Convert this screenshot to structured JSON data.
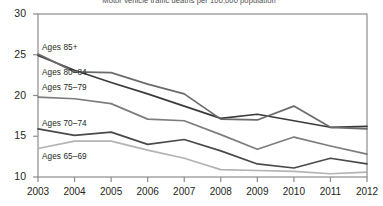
{
  "chart_data": {
    "type": "line",
    "title": "Motor vehicle traffic deaths per 100,000 population",
    "xlabel": "",
    "ylabel": "",
    "x": [
      2003,
      2004,
      2005,
      2006,
      2007,
      2008,
      2009,
      2010,
      2011,
      2012
    ],
    "xtick_labels": [
      "2003",
      "2004",
      "2005",
      "2006",
      "2007",
      "2008",
      "2009",
      "2010",
      "2011",
      "2012"
    ],
    "ytick_labels": [
      "10",
      "15",
      "20",
      "25",
      "30"
    ],
    "ytick_values": [
      10,
      15,
      20,
      25,
      30
    ],
    "ylim": [
      10,
      30
    ],
    "xlim": [
      2003,
      2012
    ],
    "grid": false,
    "legend_position": "inline-labels",
    "series": [
      {
        "name": "Ages 85+",
        "label": "Ages 85+",
        "color": "#3b3b3b",
        "values": [
          24.9,
          23.1,
          21.6,
          20.2,
          18.7,
          17.2,
          17.7,
          16.9,
          16.1,
          16.2
        ],
        "label_x": 42,
        "label_y": 43
      },
      {
        "name": "Ages 80-84",
        "label": "Ages 80–84",
        "color": "#6b6b6b",
        "values": [
          25.1,
          22.9,
          22.8,
          21.4,
          20.2,
          17.1,
          17.0,
          18.7,
          16.1,
          15.9
        ],
        "label_x": 42,
        "label_y": 68
      },
      {
        "name": "Ages 75-79",
        "label": "Ages 75–79",
        "color": "#7d7d7d",
        "values": [
          19.8,
          19.6,
          19.0,
          17.1,
          16.9,
          15.2,
          13.4,
          14.9,
          13.8,
          12.8
        ],
        "label_x": 42,
        "label_y": 83
      },
      {
        "name": "Ages 70-74",
        "label": "Ages 70–74",
        "color": "#4a4a4a",
        "values": [
          15.9,
          15.1,
          15.5,
          14.0,
          14.6,
          13.2,
          11.6,
          11.1,
          12.3,
          11.6
        ],
        "label_x": 42,
        "label_y": 119
      },
      {
        "name": "Ages 65-69",
        "label": "Ages 65–69",
        "color": "#b3b3b3",
        "values": [
          13.5,
          14.4,
          14.4,
          13.3,
          12.3,
          10.9,
          10.8,
          10.7,
          10.4,
          10.6
        ],
        "label_x": 42,
        "label_y": 152
      }
    ]
  },
  "axes": {
    "plot_left": 38,
    "plot_right": 367,
    "plot_top": 14,
    "plot_bottom": 177,
    "frame_color": "#8c8c8c"
  }
}
